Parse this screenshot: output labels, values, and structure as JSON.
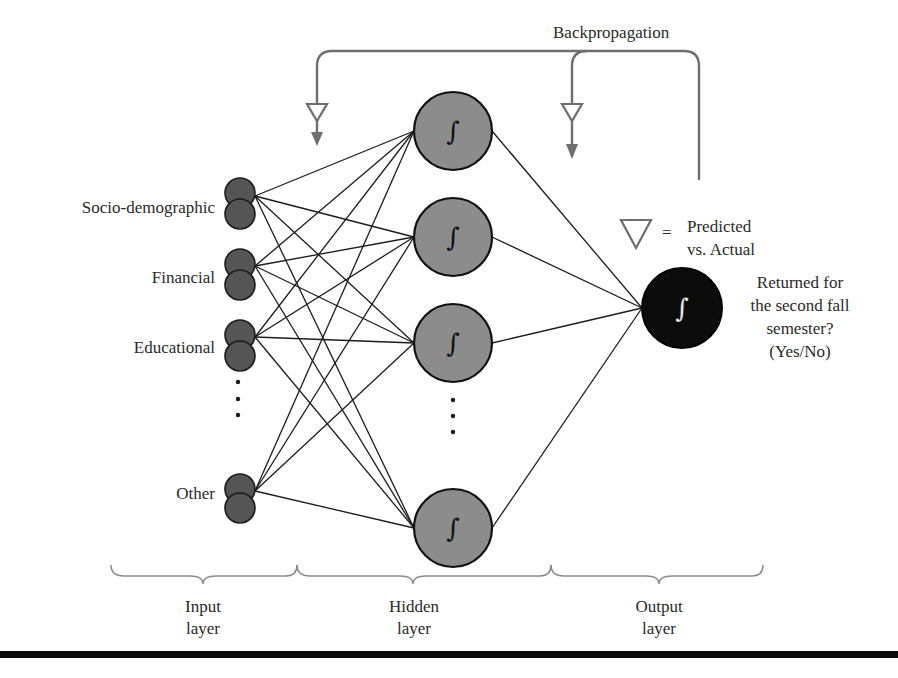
{
  "title": "Backpropagation",
  "legend": {
    "symbol": "triangle-icon",
    "equals": "=",
    "line1": "Predicted",
    "line2": "vs. Actual"
  },
  "input_layer": {
    "nodes": [
      {
        "label": "Socio-demographic"
      },
      {
        "label": "Financial"
      },
      {
        "label": "Educational"
      },
      {
        "label": "Other"
      }
    ],
    "ellipsis": "⋮"
  },
  "hidden_layer": {
    "node_symbol": "∫",
    "visible_nodes": 4,
    "ellipsis": "⋮"
  },
  "output_layer": {
    "node_symbol": "∫",
    "question_lines": [
      "Returned for",
      "the second fall",
      "semester?",
      "(Yes/No)"
    ]
  },
  "layer_labels": [
    {
      "line1": "Input",
      "line2": "layer"
    },
    {
      "line1": "Hidden",
      "line2": "layer"
    },
    {
      "line1": "Output",
      "line2": "layer"
    }
  ],
  "colors": {
    "input_node": "#555555",
    "hidden_node": "#8c8c8c",
    "output_node": "#0c0c0c",
    "backprop_line": "#6e6e6e"
  }
}
